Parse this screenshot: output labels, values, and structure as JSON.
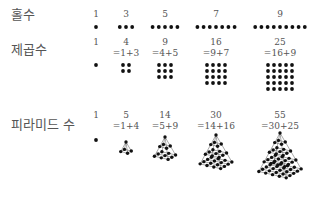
{
  "rows": [
    {
      "label": "홀수",
      "kind": "odd",
      "items": [
        {
          "value": "1",
          "n": 1
        },
        {
          "value": "3",
          "n": 3
        },
        {
          "value": "5",
          "n": 5
        },
        {
          "value": "7",
          "n": 7
        },
        {
          "value": "9",
          "n": 9
        }
      ]
    },
    {
      "label": "제곱수",
      "kind": "square",
      "items": [
        {
          "value": "1",
          "formula": "",
          "n": 1
        },
        {
          "value": "4",
          "formula": "=1+3",
          "n": 2
        },
        {
          "value": "9",
          "formula": "=4+5",
          "n": 3
        },
        {
          "value": "16",
          "formula": "=9+7",
          "n": 4
        },
        {
          "value": "25",
          "formula": "=16+9",
          "n": 5
        }
      ]
    },
    {
      "label": "피라미드 수",
      "kind": "pyramid",
      "items": [
        {
          "value": "1",
          "formula": "",
          "n": 1
        },
        {
          "value": "5",
          "formula": "=1+4",
          "n": 2
        },
        {
          "value": "14",
          "formula": "=5+9",
          "n": 3
        },
        {
          "value": "30",
          "formula": "=14+16",
          "n": 4
        },
        {
          "value": "55",
          "formula": "=30+25",
          "n": 5
        }
      ]
    }
  ]
}
